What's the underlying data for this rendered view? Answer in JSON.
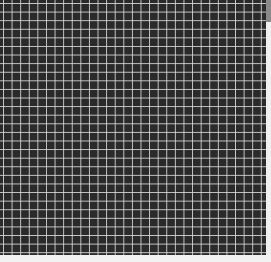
{
  "image": {
    "description": "dark textured surface with white square grid lines",
    "grid": {
      "line_color": "#e1e1e1",
      "background_color": "#2a2a2a",
      "cell_size_px": 8.6
    }
  },
  "scrollbar": {
    "thumb_color": "#8a8a8a"
  }
}
